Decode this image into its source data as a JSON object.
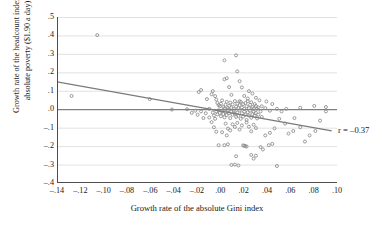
{
  "chart_data": {
    "type": "scatter",
    "title": "",
    "xlabel": "Growth rate of the absolute Gini index",
    "ylabel": "Growth rate of the headcount index of absolute poverty ($1.90 a day)",
    "ylabel_line1": "Growth rate of the headcount index of",
    "ylabel_line2": "absolute poverty ($1.90 a day)",
    "xlim": [
      -0.14,
      0.1
    ],
    "ylim": [
      -0.4,
      0.5
    ],
    "xticks": [
      -0.14,
      -0.12,
      -0.1,
      -0.08,
      -0.06,
      -0.04,
      -0.02,
      0.0,
      0.02,
      0.04,
      0.06,
      0.08,
      0.1
    ],
    "xtick_labels": [
      "–.14",
      "–.12",
      "–.10",
      "–.08",
      "–.06",
      "–.04",
      "–.02",
      ".00",
      ".02",
      ".04",
      ".06",
      ".08",
      ".10"
    ],
    "yticks": [
      0.5,
      0.4,
      0.3,
      0.2,
      0.1,
      0.0,
      -0.1,
      -0.2,
      -0.3,
      -0.4
    ],
    "ytick_labels": [
      ".5",
      ".4",
      ".3",
      ".2",
      ".1",
      ".0",
      "–.1",
      "–.2",
      "–.3",
      "–.4"
    ],
    "grid": "horizontal",
    "grid_color": "#d9d9d9",
    "zero_line": {
      "y": 0.0,
      "color": "#808080"
    },
    "legend": "none",
    "annotations": [
      {
        "text": "r = –0.37",
        "x": 0.0975,
        "y": -0.118,
        "align": "left"
      }
    ],
    "trendline": {
      "type": "linear",
      "color": "#7a7a7a",
      "x_start": -0.14,
      "y_start": 0.148,
      "x_end": 0.0955,
      "y_end": -0.118
    },
    "marker": {
      "shape": "open-circle",
      "color": "#8a8a8a",
      "size": 3
    },
    "points": [
      [
        -0.1055,
        0.402
      ],
      [
        -0.1275,
        0.072
      ],
      [
        -0.0605,
        0.055
      ],
      [
        -0.0415,
        -0.002
      ],
      [
        -0.0185,
        0.093
      ],
      [
        -0.0115,
        0.055
      ],
      [
        -0.0095,
        0.002
      ],
      [
        -0.0285,
        0.0
      ],
      [
        0.0035,
        0.265
      ],
      [
        0.0135,
        0.292
      ],
      [
        0.0035,
        0.162
      ],
      [
        -0.0165,
        0.104
      ],
      [
        -0.0075,
        0.081
      ],
      [
        -0.0065,
        0.098
      ],
      [
        -0.0045,
        0.071
      ],
      [
        -0.0035,
        0.052
      ],
      [
        -0.0025,
        0.034
      ],
      [
        -0.0015,
        0.022
      ],
      [
        -0.0005,
        0.016
      ],
      [
        0.0005,
        0.03
      ],
      [
        0.0015,
        0.048
      ],
      [
        0.0025,
        0.012
      ],
      [
        0.0035,
        0.004
      ],
      [
        0.0045,
        0.024
      ],
      [
        0.0055,
        0.04
      ],
      [
        0.0065,
        0.006
      ],
      [
        0.0075,
        0.018
      ],
      [
        0.0085,
        0.036
      ],
      [
        0.0095,
        0.008
      ],
      [
        0.0105,
        0.026
      ],
      [
        0.0115,
        0.002
      ],
      [
        0.0125,
        0.044
      ],
      [
        0.0135,
        0.014
      ],
      [
        0.0145,
        0.03
      ],
      [
        0.0155,
        0.006
      ],
      [
        0.0165,
        0.022
      ],
      [
        0.0175,
        0.04
      ],
      [
        0.0185,
        0.01
      ],
      [
        0.0195,
        0.028
      ],
      [
        0.0205,
        0.002
      ],
      [
        0.0215,
        0.034
      ],
      [
        0.0225,
        0.016
      ],
      [
        0.0235,
        0.044
      ],
      [
        0.0245,
        0.006
      ],
      [
        0.0255,
        0.024
      ],
      [
        0.0265,
        0.038
      ],
      [
        0.0275,
        0.012
      ],
      [
        0.0285,
        0.004
      ],
      [
        0.0295,
        0.028
      ],
      [
        0.0305,
        0.018
      ],
      [
        0.0315,
        0.002
      ],
      [
        0.0325,
        0.01
      ],
      [
        -0.0065,
        -0.018
      ],
      [
        -0.0055,
        -0.034
      ],
      [
        -0.0045,
        -0.052
      ],
      [
        -0.0035,
        -0.012
      ],
      [
        -0.0025,
        -0.028
      ],
      [
        -0.0015,
        -0.006
      ],
      [
        -0.0005,
        -0.02
      ],
      [
        0.0005,
        -0.038
      ],
      [
        0.0015,
        -0.01
      ],
      [
        0.0025,
        -0.026
      ],
      [
        0.0035,
        -0.044
      ],
      [
        0.0045,
        -0.016
      ],
      [
        0.0055,
        -0.032
      ],
      [
        0.0065,
        -0.004
      ],
      [
        0.0075,
        -0.022
      ],
      [
        0.0085,
        -0.048
      ],
      [
        0.0095,
        -0.014
      ],
      [
        0.0105,
        -0.03
      ],
      [
        0.0115,
        -0.008
      ],
      [
        0.0125,
        -0.024
      ],
      [
        0.0135,
        -0.042
      ],
      [
        0.0145,
        -0.018
      ],
      [
        0.0155,
        -0.036
      ],
      [
        0.0165,
        -0.006
      ],
      [
        0.0175,
        -0.052
      ],
      [
        0.0185,
        -0.022
      ],
      [
        0.0195,
        -0.04
      ],
      [
        0.0205,
        -0.012
      ],
      [
        0.0215,
        -0.03
      ],
      [
        0.0225,
        -0.058
      ],
      [
        0.0235,
        -0.016
      ],
      [
        0.0245,
        -0.034
      ],
      [
        0.0255,
        -0.008
      ],
      [
        0.0265,
        -0.046
      ],
      [
        0.0275,
        -0.026
      ],
      [
        0.0285,
        -0.014
      ],
      [
        0.0295,
        -0.036
      ],
      [
        0.0305,
        -0.02
      ],
      [
        0.0315,
        -0.05
      ],
      [
        0.0325,
        -0.03
      ],
      [
        0.0345,
        -0.012
      ],
      [
        0.0355,
        -0.042
      ],
      [
        0.0105,
        -0.082
      ],
      [
        0.0125,
        -0.096
      ],
      [
        0.0145,
        -0.074
      ],
      [
        0.0165,
        -0.11
      ],
      [
        0.0185,
        -0.088
      ],
      [
        0.0065,
        -0.105
      ],
      [
        0.0045,
        -0.078
      ],
      [
        0.0225,
        -0.072
      ],
      [
        0.0245,
        -0.095
      ],
      [
        0.0265,
        -0.12
      ],
      [
        0.0285,
        -0.084
      ],
      [
        0.0305,
        -0.102
      ],
      [
        0.0205,
        -0.198
      ],
      [
        0.0215,
        -0.2
      ],
      [
        0.0225,
        -0.202
      ],
      [
        0.0195,
        -0.196
      ],
      [
        0.0345,
        -0.205
      ],
      [
        0.0365,
        -0.218
      ],
      [
        0.0265,
        -0.248
      ],
      [
        0.0305,
        -0.252
      ],
      [
        0.0285,
        -0.268
      ],
      [
        0.0135,
        -0.255
      ],
      [
        0.0095,
        -0.302
      ],
      [
        0.0125,
        -0.3
      ],
      [
        0.0415,
        -0.195
      ],
      [
        0.0445,
        -0.188
      ],
      [
        0.0385,
        -0.142
      ],
      [
        0.0425,
        -0.128
      ],
      [
        0.0465,
        -0.104
      ],
      [
        0.0505,
        -0.052
      ],
      [
        0.0555,
        -0.078
      ],
      [
        0.0585,
        -0.132
      ],
      [
        0.0625,
        -0.118
      ],
      [
        0.0485,
        0.002
      ],
      [
        0.0525,
        -0.012
      ],
      [
        0.0635,
        -0.048
      ],
      [
        0.0685,
        -0.098
      ],
      [
        0.0725,
        -0.175
      ],
      [
        0.0765,
        -0.142
      ],
      [
        0.0815,
        -0.118
      ],
      [
        0.0855,
        -0.062
      ],
      [
        0.0905,
        -0.012
      ],
      [
        0.0445,
        0.028
      ],
      [
        0.0395,
        0.042
      ],
      [
        0.0305,
        0.062
      ],
      [
        0.0275,
        0.085
      ],
      [
        0.0185,
        0.118
      ],
      [
        0.0205,
        0.072
      ],
      [
        0.0235,
        0.058
      ],
      [
        0.0165,
        0.044
      ],
      [
        0.0095,
        0.078
      ],
      [
        0.0075,
        0.12
      ],
      [
        0.0055,
        0.168
      ],
      [
        0.0355,
        0.016
      ],
      [
        0.0385,
        0.006
      ],
      [
        0.0425,
        -0.008
      ],
      [
        0.0155,
        -0.305
      ],
      [
        0.0485,
        -0.308
      ],
      [
        0.0065,
        -0.19
      ],
      [
        0.0035,
        -0.195
      ],
      [
        -0.0015,
        -0.195
      ],
      [
        -0.0035,
        -0.122
      ],
      [
        -0.0055,
        -0.098
      ],
      [
        -0.0075,
        -0.07
      ],
      [
        -0.0095,
        -0.045
      ],
      [
        0.0015,
        -0.125
      ],
      [
        0.0055,
        -0.142
      ],
      [
        0.0085,
        -0.115
      ],
      [
        -0.0125,
        -0.022
      ],
      [
        -0.0145,
        -0.048
      ],
      [
        -0.0165,
        -0.012
      ],
      [
        -0.0195,
        -0.03
      ],
      [
        -0.0215,
        -0.008
      ],
      [
        -0.0245,
        -0.02
      ],
      [
        0.0165,
        0.152
      ],
      [
        0.0145,
        0.205
      ],
      [
        0.0335,
        0.048
      ],
      [
        0.0245,
        0.098
      ],
      [
        0.0905,
        0.012
      ],
      [
        0.0805,
        0.018
      ],
      [
        0.0685,
        0.008
      ],
      [
        0.0565,
        0.002
      ]
    ]
  }
}
